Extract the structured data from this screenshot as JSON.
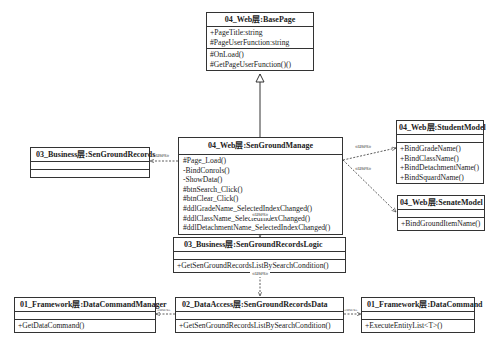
{
  "classes": {
    "base_page": {
      "title": "04_Web层:BasePage",
      "attributes": [
        "+PageTitle:string",
        "#PageUserFunction:string"
      ],
      "operations": [
        "#OnLoad()",
        "#GetPageUserFunction()()"
      ]
    },
    "sen_ground_manage": {
      "title": "04_Web层:SenGroundManage",
      "attributes": [],
      "operations": [
        "#Page_Load()",
        "-BindConrols()",
        "-ShowData()",
        "#btnSearch_Click()",
        "#btnClear_Click()",
        "#ddlGradeName_SelectedIndexChanged()",
        "#ddlClassName_SelectedIndexChanged()",
        "#ddlDetachmentName_SelectedIndexChanged()"
      ]
    },
    "sen_ground_records": {
      "title": "03_Business层:SenGroundRecords",
      "attributes": [],
      "operations": []
    },
    "student_model": {
      "title": "04_Web层:StudentModel",
      "attributes": [],
      "operations": [
        "+BindGradeName()",
        "+BindClassName()",
        "+BindDetachmentName()",
        "+BindSquardName()"
      ]
    },
    "senate_model": {
      "title": "04_Web层:SenateModel",
      "attributes": [],
      "operations": [
        "+BindGroundItemName()"
      ]
    },
    "records_logic": {
      "title": "03_Business层:SenGroundRecordsLogic",
      "attributes": [],
      "operations": [
        "+GetSenGroundRecordsListBySearchCondition()"
      ]
    },
    "records_data": {
      "title": "02_DataAccess层:SenGroundRecordsData",
      "attributes": [],
      "operations": [
        "+GetSenGroundRecordsListBySearchCondition()"
      ]
    },
    "data_command_manager": {
      "title": "01_Framework层:DataCommandManager",
      "attributes": [],
      "operations": [
        "+GetDataCommand()"
      ]
    },
    "data_command": {
      "title": "01_Framework层:DataCommand",
      "attributes": [],
      "operations": [
        "+ExecuteEntityList<T>()"
      ]
    }
  },
  "relations": {
    "uses_label": "«uses»",
    "uses_records": "«uses»",
    "uses_student": "«uses»",
    "uses_senate": "«uses»",
    "uses_logic": "«uses»",
    "uses_data": "«uses»",
    "uses_manager": "«uses»",
    "uses_command": "«uses»"
  }
}
